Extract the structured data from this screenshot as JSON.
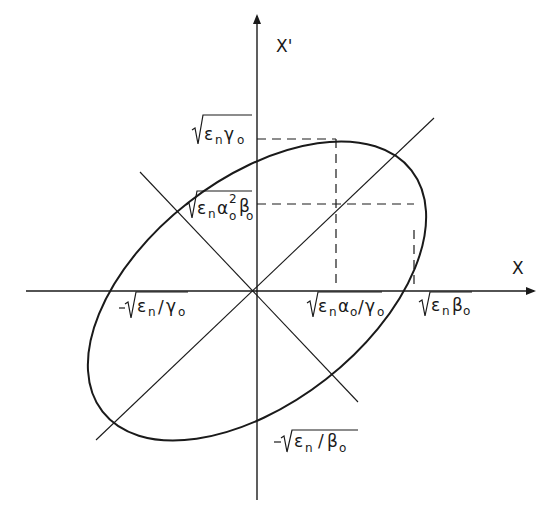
{
  "diagram": {
    "type": "phase-space emittance ellipse",
    "axes": {
      "x_label": "X",
      "y_label": "X'"
    },
    "labels": {
      "top_x_prime": {
        "radical": "ε",
        "sub1": "n",
        "mid": "γ",
        "sub2": "o",
        "text": "√(εnγo)"
      },
      "x_prime_at_max_x": {
        "text": "√(εnαo²βo)"
      },
      "x_intercept_neg": {
        "text": "-√(εn/γo)"
      },
      "x_at_max_x_prime": {
        "text": "√(εnαo/γo)"
      },
      "max_x": {
        "text": "√(εnβo)"
      },
      "y_intercept_neg": {
        "text": "-√(εn/βo)"
      }
    },
    "colors": {
      "stroke": "#1a1a1a",
      "background": "#ffffff"
    }
  }
}
